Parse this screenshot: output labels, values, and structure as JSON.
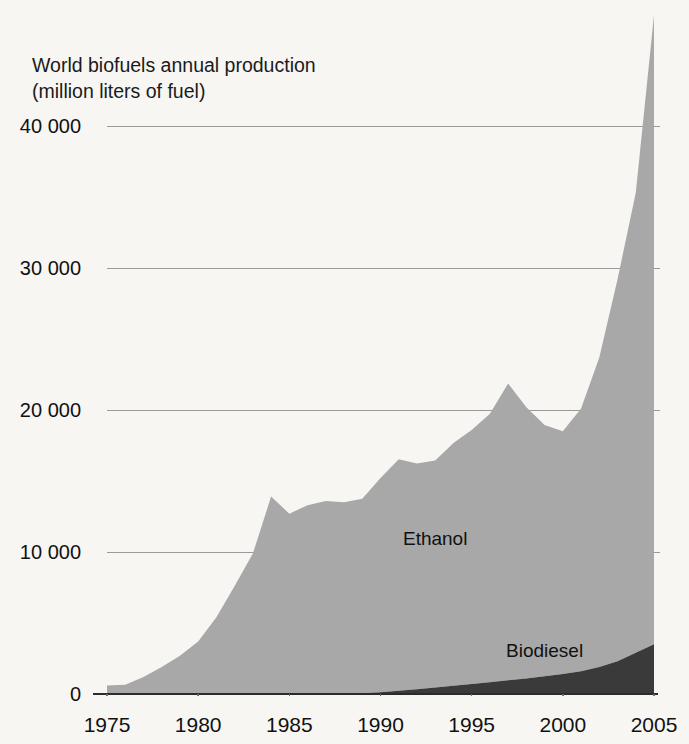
{
  "figure": {
    "title_line1": "World biofuels annual production",
    "title_line2": "(million liters of fuel)",
    "background_color": "#fdfdfc"
  },
  "colors": {
    "ethanol_fill": "#a8a8a8",
    "biodiesel_fill": "#3a3a3a",
    "gridline": "#9a9a9a",
    "axis": "#2b2b2b",
    "text": "#111111"
  },
  "chart_data": {
    "type": "area",
    "stacked": true,
    "title": "World biofuels annual production (million liters of fuel)",
    "xlabel": "",
    "ylabel": "million liters of fuel",
    "grid": true,
    "legend_position": "inline-labels",
    "xlim": [
      1975,
      2005
    ],
    "ylim": [
      0,
      40000
    ],
    "y_ticks": [
      0,
      10000,
      20000,
      30000,
      40000
    ],
    "y_tick_labels": [
      "0",
      "10 000",
      "20 000",
      "30 000",
      "40 000"
    ],
    "x_ticks": [
      1975,
      1980,
      1985,
      1990,
      1995,
      2000,
      2005
    ],
    "x_tick_labels": [
      "1975",
      "1980",
      "1985",
      "1990",
      "1995",
      "2000",
      "2005"
    ],
    "note": "Top of the 2005 spike extends above the 40 000 gridline, beyond the plotted axis range.",
    "x": [
      1975,
      1976,
      1977,
      1978,
      1979,
      1980,
      1981,
      1982,
      1983,
      1984,
      1985,
      1986,
      1987,
      1988,
      1989,
      1990,
      1991,
      1992,
      1993,
      1994,
      1995,
      1996,
      1997,
      1998,
      1999,
      2000,
      2001,
      2002,
      2003,
      2004,
      2005
    ],
    "series": [
      {
        "name": "Ethanol",
        "color": "#a8a8a8",
        "label_x": 1993,
        "label_y": 10500,
        "values": [
          600,
          650,
          1200,
          1900,
          2700,
          3700,
          5400,
          7600,
          9900,
          13900,
          12700,
          13300,
          13600,
          13500,
          13700,
          15100,
          16300,
          15900,
          16000,
          17100,
          17900,
          18900,
          20900,
          19100,
          17700,
          17100,
          18500,
          21800,
          26900,
          32400,
          44300
        ]
      },
      {
        "name": "Biodiesel",
        "color": "#3a3a3a",
        "label_x": 1999,
        "label_y": 2600,
        "values": [
          0,
          0,
          0,
          0,
          0,
          0,
          0,
          0,
          0,
          0,
          0,
          0,
          0,
          0,
          50,
          120,
          230,
          330,
          450,
          580,
          700,
          830,
          960,
          1100,
          1250,
          1400,
          1600,
          1900,
          2300,
          2900,
          3500
        ]
      }
    ]
  }
}
